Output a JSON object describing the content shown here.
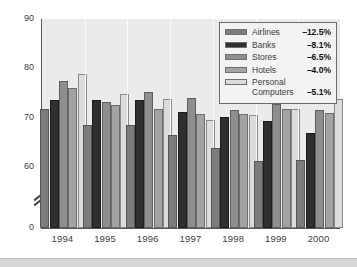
{
  "chart_data": {
    "type": "bar",
    "title": "",
    "xlabel": "",
    "ylabel": "",
    "categories": [
      "1994",
      "1995",
      "1996",
      "1997",
      "1998",
      "1999",
      "2000"
    ],
    "ylim": [
      0,
      90
    ],
    "yticks": [
      0,
      60,
      70,
      80,
      90
    ],
    "ytick_labels": [
      "0",
      "60",
      "70",
      "80",
      "90"
    ],
    "axis_break": true,
    "axis_break_between": [
      0,
      60
    ],
    "grid": false,
    "legend_position": "top-right",
    "series": [
      {
        "name": "Airlines",
        "change": "–12.5%",
        "color": "#7c7c7c",
        "values": [
          71.8,
          68.5,
          68.5,
          66.5,
          63.8,
          61.3,
          61.5
        ]
      },
      {
        "name": "Banks",
        "change": "–8.1%",
        "color": "#2f2f2f",
        "values": [
          73.5,
          73.5,
          73.5,
          71.2,
          70.2,
          69.4,
          66.9
        ]
      },
      {
        "name": "Stores",
        "change": "–6.5%",
        "color": "#8e8e8e",
        "values": [
          77.5,
          73.2,
          75.2,
          74.0,
          71.5,
          72.7,
          71.5
        ]
      },
      {
        "name": "Hotels",
        "change": "–4.0%",
        "color": "#a3a3a3",
        "values": [
          76.0,
          72.5,
          71.8,
          70.8,
          70.8,
          71.8,
          71.0
        ]
      },
      {
        "name": "Personal\nComputers",
        "change": "–5.1%",
        "color": "#dcdcdc",
        "values": [
          78.8,
          74.8,
          73.7,
          69.6,
          70.6,
          71.7,
          73.7
        ]
      }
    ]
  }
}
